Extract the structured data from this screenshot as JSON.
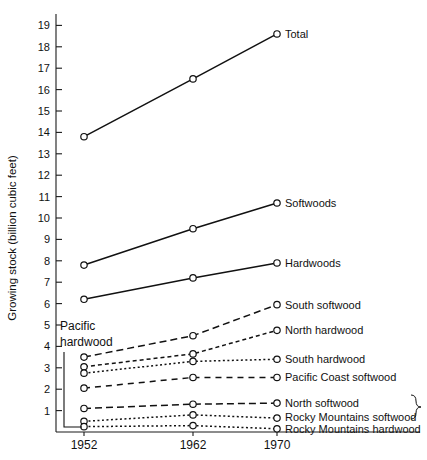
{
  "chart_data": {
    "type": "line",
    "title": "",
    "xlabel": "",
    "ylabel": "Growing stock (billion cubic feet)",
    "x": [
      "1952",
      "1962",
      "1970"
    ],
    "xtick_labels": [
      "1952",
      "1962",
      "1970"
    ],
    "ytick_labels": [
      "1",
      "2",
      "3",
      "4",
      "5",
      "6",
      "7",
      "8",
      "9",
      "10",
      "11",
      "12",
      "13",
      "14",
      "15",
      "16",
      "17",
      "18",
      "19"
    ],
    "ylim": [
      0,
      19
    ],
    "ytick_values": [
      1,
      2,
      3,
      4,
      5,
      6,
      7,
      8,
      9,
      10,
      11,
      12,
      13,
      14,
      15,
      16,
      17,
      18,
      19
    ],
    "grid": false,
    "legend_position": "right-inline-labels",
    "series": [
      {
        "name": "Total",
        "label": "Total",
        "values": [
          13.8,
          16.5,
          18.6
        ],
        "style": "solid"
      },
      {
        "name": "Softwoods",
        "label": "Softwoods",
        "values": [
          7.8,
          9.5,
          10.7
        ],
        "style": "solid"
      },
      {
        "name": "Hardwoods",
        "label": "Hardwoods",
        "values": [
          6.2,
          7.2,
          7.9
        ],
        "style": "solid"
      },
      {
        "name": "South softwood",
        "label": "South softwood",
        "values": [
          3.5,
          4.5,
          5.95
        ],
        "style": "dashed-long"
      },
      {
        "name": "North hardwood",
        "label": "North hardwood",
        "values": [
          3.05,
          3.65,
          4.75
        ],
        "style": "dashed-short"
      },
      {
        "name": "South hardwood",
        "label": "South hardwood",
        "values": [
          2.75,
          3.3,
          3.4
        ],
        "style": "dotted-fine"
      },
      {
        "name": "Pacific Coast softwood",
        "label": "Pacific Coast softwood",
        "values": [
          2.05,
          2.55,
          2.55
        ],
        "style": "dash-dash"
      },
      {
        "name": "North softwood",
        "label": "North softwood",
        "values": [
          1.1,
          1.3,
          1.35
        ],
        "style": "dashed-long"
      },
      {
        "name": "Rocky Mountains softwood",
        "label": "Rocky Mountains softwood",
        "values": [
          0.5,
          0.8,
          0.65
        ],
        "style": "dotted-fine"
      },
      {
        "name": "Rocky Mountains hardwood",
        "label": "Rocky Mountains hardwood",
        "values": [
          0.25,
          0.3,
          0.15
        ],
        "style": "dotted-fine"
      }
    ],
    "annotations": [
      {
        "name": "pacific-hardwood-callout",
        "text_line1": "Pacific",
        "text_line2": "hardwood",
        "points_to": "Rocky Mountains hardwood 1952"
      }
    ],
    "grouping_brace": {
      "members": [
        "North softwood",
        "Rocky Mountains softwood"
      ]
    }
  },
  "colors": {
    "ink": "#111111",
    "background": "#ffffff"
  }
}
